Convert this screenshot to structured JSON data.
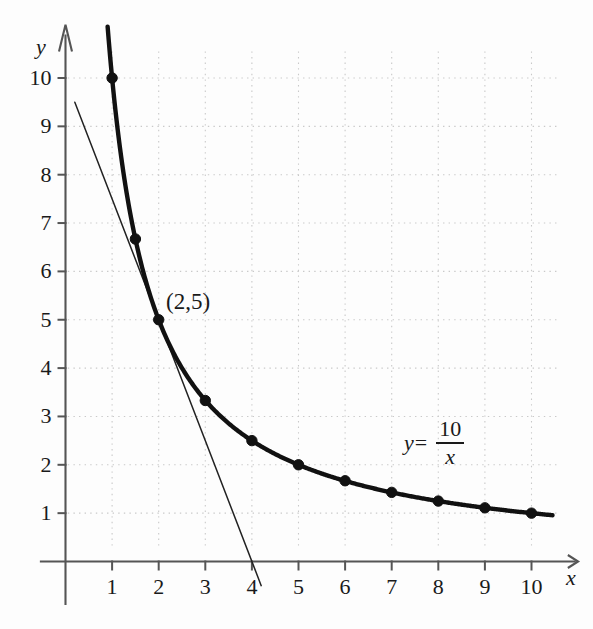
{
  "chart_data": {
    "type": "line",
    "title": "",
    "xlabel": "x",
    "ylabel": "y",
    "equation_label": {
      "lhs": "y",
      "equals": "=",
      "numerator": "10",
      "denominator": "x",
      "full": "y = 10/x"
    },
    "annotations": [
      {
        "text": "(2,5)",
        "x": 2,
        "y": 5
      }
    ],
    "xlim": [
      0,
      10.6
    ],
    "ylim": [
      0,
      10.6
    ],
    "xticks": [
      1,
      2,
      3,
      4,
      5,
      6,
      7,
      8,
      9,
      10
    ],
    "xtick_labels": [
      "1",
      "2",
      "3",
      "4",
      "5",
      "6",
      "7",
      "8",
      "9",
      "10"
    ],
    "yticks": [
      1,
      2,
      3,
      4,
      5,
      6,
      7,
      8,
      9,
      10
    ],
    "ytick_labels": [
      "1",
      "2",
      "3",
      "4",
      "5",
      "6",
      "7",
      "8",
      "9",
      "10"
    ],
    "grid": true,
    "grid_style": "dotted",
    "grid_color": "#c9c9c9",
    "axis_color": "#555555",
    "curve_color": "#111111",
    "tangent_color": "#222222",
    "marker_color": "#111111",
    "legend": "none",
    "series": [
      {
        "name": "y = 10/x",
        "type": "curve",
        "marked_points": {
          "x": [
            1,
            1.5,
            2,
            3,
            4,
            5,
            6,
            7,
            8,
            9,
            10
          ],
          "y": [
            10,
            6.67,
            5,
            3.33,
            2.5,
            2,
            1.67,
            1.43,
            1.25,
            1.11,
            1
          ]
        }
      },
      {
        "name": "tangent at (2,5)",
        "type": "line",
        "slope": -2.5,
        "x": [
          0.2,
          4.2
        ],
        "y": [
          9.5,
          -0.5
        ],
        "x_intercept": 4,
        "y_intercept": 10
      }
    ]
  }
}
